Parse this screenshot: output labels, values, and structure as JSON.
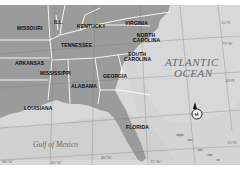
{
  "map": {
    "states": [
      {
        "id": "missouri",
        "label": "MISSOURI"
      },
      {
        "id": "illinois",
        "label": "ILL."
      },
      {
        "id": "kentucky",
        "label": "KENTUCKY"
      },
      {
        "id": "virginia",
        "label": "VIRGINIA"
      },
      {
        "id": "north-carolina",
        "label": "NORTH CAROLINA"
      },
      {
        "id": "tennessee",
        "label": "TENNESSEE"
      },
      {
        "id": "south-carolina",
        "label": "SOUTH CAROLINA"
      },
      {
        "id": "arkansas",
        "label": "ARKANSAS"
      },
      {
        "id": "mississippi",
        "label": "MISSISSIPPI"
      },
      {
        "id": "alabama",
        "label": "ALABAMA"
      },
      {
        "id": "georgia",
        "label": "GEORGIA"
      },
      {
        "id": "louisiana",
        "label": "LOUISIANA"
      },
      {
        "id": "florida",
        "label": "FLORIDA"
      }
    ],
    "water": {
      "atlantic_line1": "ATLANTIC",
      "atlantic_line2": "OCEAN",
      "gulf": "Gulf of Mexico"
    },
    "coordinates": {
      "lat_35": "35°N",
      "lon_75": "75°W",
      "lat_30": "30°N",
      "lat_25": "25°N",
      "lon_90": "90°W",
      "lon_85": "85°W",
      "lon_80": "80°W",
      "lon_75b": "75°W"
    },
    "compass": {
      "label": "N"
    },
    "colors": {
      "land": "#9a9a9a",
      "ocean": "#d6d6d6",
      "shallow": "#c9c9c9",
      "borders": "#ffffff",
      "grid": "#777777"
    }
  }
}
